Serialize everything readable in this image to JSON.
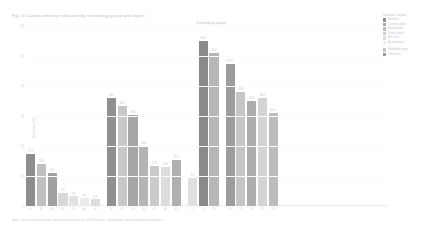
{
  "chart": {
    "title": "Fig. 3  Carbon-intensity reduction by technology group and region",
    "group_axis_label": "Technology group",
    "caption": "Note: values are percentage reductions relative to the 2015 baseline; shaded bars denote modelled estimates.",
    "ylabel": "Reduction (%)",
    "yticks": [
      "60",
      "50",
      "40",
      "30",
      "20",
      "10",
      "0"
    ],
    "legend_title": "Scenario / region",
    "legend": [
      {
        "label": "Baseline",
        "color": "#8e8e8e"
      },
      {
        "label": "Current policy",
        "color": "#a8a8a8"
      },
      {
        "label": "Announced",
        "color": "#bdbdbd"
      },
      {
        "label": "Stated goals",
        "color": "#cfcfcf"
      },
      {
        "label": "Net zero",
        "color": "#dedede"
      },
      {
        "label": "Accelerated",
        "color": "#ededed"
      },
      {
        "label": "Modelled range",
        "color": "#c4c4c4"
      },
      {
        "label": "Observed",
        "color": "#9b9b9b"
      }
    ]
  },
  "chart_data": {
    "type": "bar",
    "title": "Fig. 3  Carbon-intensity reduction by technology group and region",
    "xlabel": "Technology group",
    "ylabel": "Reduction (%)",
    "ylim": [
      0,
      60
    ],
    "grid": false,
    "legend_position": "right",
    "groups": [
      {
        "name": "Group A",
        "categories": [
          "A1",
          "A2",
          "A3",
          "A4",
          "A5",
          "A6",
          "A7"
        ],
        "values": [
          17.5,
          14.0,
          11.0,
          4.5,
          3.2,
          2.6,
          2.2
        ],
        "colors": [
          "#8e8e8e",
          "#c0c0c0",
          "#a0a0a0",
          "#d8d8d8",
          "#e2e2e2",
          "#ebebeb",
          "#dcdcdc"
        ],
        "labels": [
          "17.5",
          "14.0",
          "11.0",
          "4.5",
          "3.2",
          "2.6",
          "2.2"
        ]
      },
      {
        "name": "Group B",
        "categories": [
          "B1",
          "B2",
          "B3",
          "B4",
          "B5",
          "B6",
          "B7"
        ],
        "values": [
          36.0,
          33.5,
          30.5,
          20.0,
          13.5,
          13.0,
          15.5
        ],
        "colors": [
          "#909090",
          "#c8c8c8",
          "#a6a6a6",
          "#b4b4b4",
          "#cacaca",
          "#dcdcdc",
          "#b0b0b0"
        ],
        "labels": [
          "36.0",
          "33.5",
          "30.5",
          "20.0",
          "13.5",
          "13.0",
          "15.5"
        ]
      },
      {
        "name": "Group C",
        "categories": [
          "C1",
          "C2",
          "C3"
        ],
        "values": [
          9.5,
          55.0,
          51.0
        ],
        "colors": [
          "#e0e0e0",
          "#8a8a8a",
          "#b6b6b6"
        ],
        "labels": [
          "9.5",
          "55.0",
          "51.0"
        ]
      },
      {
        "name": "Group D",
        "categories": [
          "D1",
          "D2",
          "D3",
          "D4",
          "D5"
        ],
        "values": [
          47.5,
          38.0,
          35.0,
          36.0,
          31.0
        ],
        "colors": [
          "#9c9c9c",
          "#c6c6c6",
          "#adadad",
          "#d4d4d4",
          "#bcbcbc"
        ],
        "labels": [
          "47.5",
          "38.0",
          "35.0",
          "36.0",
          "31.0"
        ]
      }
    ]
  }
}
